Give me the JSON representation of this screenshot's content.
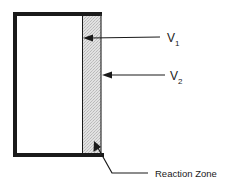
{
  "diagram": {
    "title": "",
    "labels": {
      "v1": {
        "main": "V",
        "sub": "1"
      },
      "v2": {
        "main": "V",
        "sub": "2"
      },
      "reaction_zone": "Reaction Zone"
    },
    "colors": {
      "frame": "#1a1a1a",
      "zone_fill": "#d9d9d9",
      "background": "#ffffff"
    }
  }
}
